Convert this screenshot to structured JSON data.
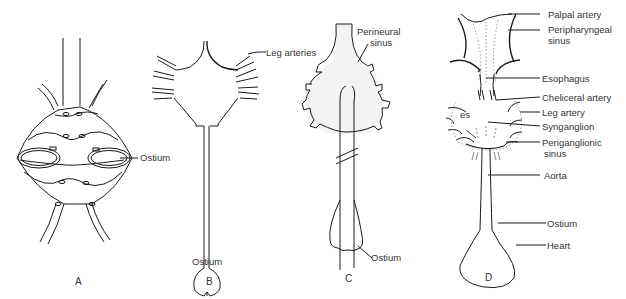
{
  "figure": {
    "panels": [
      {
        "id": "A",
        "letter": "A",
        "labels": {
          "ostium": "Ostium"
        }
      },
      {
        "id": "B",
        "letter": "B",
        "labels": {
          "leg_arteries": "Leg arteries",
          "ostium": "Ostium"
        }
      },
      {
        "id": "C",
        "letter": "C",
        "labels": {
          "perineural_l1": "Perineural",
          "perineural_l2": "sinus",
          "ostium": "Ostium"
        }
      },
      {
        "id": "D",
        "letter": "D",
        "labels": {
          "palpal_artery": "Palpal artery",
          "peripharyngeal_l1": "Peripharyngeal",
          "peripharyngeal_l2": "sinus",
          "esophagus": "Esophagus",
          "cheliceral_artery": "Cheliceral artery",
          "leg_artery": "Leg artery",
          "es": "es",
          "synganglion": "Synganglion",
          "periganglionic_l1": "Periganglionic",
          "periganglionic_l2": "sinus",
          "aorta": "Aorta",
          "ostium": "Ostium",
          "heart": "Heart"
        }
      }
    ],
    "colors": {
      "line": "#1a1a1a",
      "sinus_fill": "#f2f2f2",
      "dotted": "#999999"
    }
  }
}
